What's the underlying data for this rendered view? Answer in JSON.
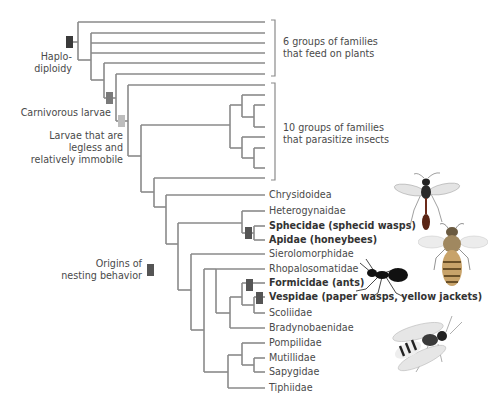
{
  "figure": {
    "type": "phylogenetic-tree",
    "line_color": "#8a8a8a",
    "marker_colors": {
      "haplodiploidy": "#3a3a3a",
      "carnivorous_larvae": "#7a7a7a",
      "legless_larvae": "#bdbdbd",
      "nesting": "#555555"
    }
  },
  "groups": {
    "plant_feeders": "6 groups of families\nthat feed on plants",
    "plant_feeders_line1": "6 groups of families",
    "plant_feeders_line2": "that feed on plants",
    "parasitoids_line1": "10 groups of families",
    "parasitoids_line2": "that parasitize insects"
  },
  "traits": {
    "haplodiploidy_line1": "Haplo-",
    "haplodiploidy_line2": "diploidy",
    "carnivorous": "Carnivorous larvae",
    "legless_line1": "Larvae that are",
    "legless_line2": "legless and",
    "legless_line3": "relatively immobile",
    "nesting_line1": "Origins of",
    "nesting_line2": "nesting behavior"
  },
  "taxa": [
    {
      "name": "Chrysidoidea",
      "bold": false
    },
    {
      "name": "Heterogynaidae",
      "bold": false
    },
    {
      "name": "Sphecidae (sphecid wasps)",
      "bold": true
    },
    {
      "name": "Apidae (honeybees)",
      "bold": true
    },
    {
      "name": "Sierolomorphidae",
      "bold": false
    },
    {
      "name": "Rhopalosomatidae",
      "bold": false
    },
    {
      "name": "Formicidae (ants)",
      "bold": true
    },
    {
      "name": "Vespidae (paper wasps, yellow jackets)",
      "bold": true
    },
    {
      "name": "Scoliidae",
      "bold": false
    },
    {
      "name": "Bradynobaenidae",
      "bold": false
    },
    {
      "name": "Pompilidae",
      "bold": false
    },
    {
      "name": "Mutillidae",
      "bold": false
    },
    {
      "name": "Sapygidae",
      "bold": false
    },
    {
      "name": "Tiphiidae",
      "bold": false
    }
  ],
  "illustrations": [
    "sphecid-wasp",
    "honeybee",
    "ant",
    "yellow-jacket"
  ]
}
